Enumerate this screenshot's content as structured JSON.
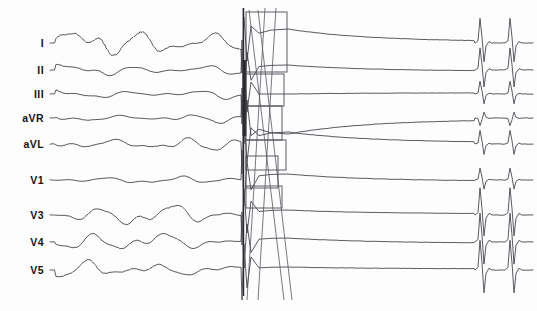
{
  "figure": {
    "kind": "ecg-strip",
    "width": 537,
    "height": 311,
    "background_color": "#fdfdfd",
    "trace_color": "#3c3c46",
    "shock_bar_color": "#2a2a30",
    "artifact_color": "#55555f"
  },
  "leads": [
    {
      "id": "lead-i",
      "label": "I",
      "label_x": 44,
      "label_y": 43,
      "baseline": 43,
      "amplitude": 17.0,
      "phase": 0.0,
      "post_offset": -14,
      "qrs_scale": 1.45
    },
    {
      "id": "lead-ii",
      "label": "II",
      "label_x": 44,
      "label_y": 70,
      "baseline": 70,
      "amplitude": 6.5,
      "phase": 0.55,
      "post_offset": -5,
      "qrs_scale": 1.3
    },
    {
      "id": "lead-iii",
      "label": "III",
      "label_x": 44,
      "label_y": 94,
      "baseline": 94,
      "amplitude": 5.0,
      "phase": 1.15,
      "post_offset": 0,
      "qrs_scale": 0.75
    },
    {
      "id": "lead-avr",
      "label": "aVR",
      "label_x": 44,
      "label_y": 118,
      "baseline": 118,
      "amplitude": 4.8,
      "phase": 1.85,
      "post_offset": 16,
      "qrs_scale": 0.45
    },
    {
      "id": "lead-avl",
      "label": "aVL",
      "label_x": 44,
      "label_y": 144,
      "baseline": 144,
      "amplitude": 8.0,
      "phase": 2.4,
      "post_offset": -12,
      "qrs_scale": 0.8
    },
    {
      "id": "lead-v1",
      "label": "V1",
      "label_x": 44,
      "label_y": 180,
      "baseline": 180,
      "amplitude": 4.2,
      "phase": 3.05,
      "post_offset": -6,
      "qrs_scale": 0.7
    },
    {
      "id": "lead-v3",
      "label": "V3",
      "label_x": 44,
      "label_y": 215,
      "baseline": 215,
      "amplitude": 11.5,
      "phase": 3.7,
      "post_offset": -5,
      "qrs_scale": 1.6
    },
    {
      "id": "lead-v4",
      "label": "V4",
      "label_x": 44,
      "label_y": 242,
      "baseline": 242,
      "amplitude": 11.0,
      "phase": 4.35,
      "post_offset": -4,
      "qrs_scale": 1.7
    },
    {
      "id": "lead-v5",
      "label": "V5",
      "label_x": 44,
      "label_y": 270,
      "baseline": 270,
      "amplitude": 10.0,
      "phase": 5.0,
      "post_offset": -3,
      "qrs_scale": 1.75
    }
  ],
  "segments": {
    "pre_shock": {
      "x_start": 56,
      "x_end": 241,
      "description": "ventricular fibrillation"
    },
    "shock": {
      "x_start": 241,
      "x_end": 288,
      "description": "defibrillation shock artifact"
    },
    "post_shock": {
      "x_start": 288,
      "x_end": 537,
      "description": "post-shock recovery with returning QRS complexes"
    }
  },
  "shock_bar": {
    "x": 242.5,
    "width": 2.6,
    "y_top": 8,
    "y_bottom": 296,
    "dark_top": 60,
    "dark_bottom": 136
  },
  "artifact_boxes": [
    {
      "x": 246,
      "y": 12,
      "width": 41,
      "height": 60
    },
    {
      "x": 246,
      "y": 74,
      "width": 38,
      "height": 32
    },
    {
      "x": 246,
      "y": 106,
      "width": 36,
      "height": 34
    },
    {
      "x": 246,
      "y": 140,
      "width": 40,
      "height": 30
    },
    {
      "x": 246,
      "y": 156,
      "width": 32,
      "height": 32
    },
    {
      "x": 246,
      "y": 186,
      "width": 36,
      "height": 22
    }
  ],
  "artifact_diagonals": [
    {
      "x1": 265,
      "y1": 8,
      "x2": 247,
      "y2": 300
    },
    {
      "x1": 276,
      "y1": 8,
      "x2": 258,
      "y2": 300
    },
    {
      "x1": 249,
      "y1": 10,
      "x2": 284,
      "y2": 300
    },
    {
      "x1": 258,
      "y1": 10,
      "x2": 292,
      "y2": 300
    }
  ],
  "recovery_beats": {
    "first_beat_x": 480,
    "second_beat_x": 510
  }
}
